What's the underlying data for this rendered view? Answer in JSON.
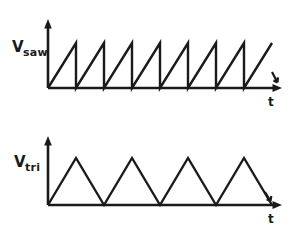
{
  "figure": {
    "background_color": "#ffffff",
    "ink_color": "#1a1a1a",
    "width": 295,
    "height": 231
  },
  "chart_data": [
    {
      "type": "line",
      "name": "sawtooth-waveform",
      "title": "",
      "ylabel": "V",
      "ylabel_subscript": "saw",
      "xlabel": "t",
      "waveform": "sawtooth",
      "cycles": 8,
      "period": 28,
      "amplitude": 45,
      "grid": false,
      "legend": false,
      "axis": {
        "origin_x": 48,
        "baseline_y": 88,
        "y_axis_top": 20,
        "x_axis_end": 282,
        "xlim": [
          0,
          8
        ],
        "ylim": [
          0,
          1
        ]
      },
      "x": [
        0,
        1,
        1,
        2,
        2,
        3,
        3,
        4,
        4,
        5,
        5,
        6,
        6,
        7,
        7,
        8
      ],
      "y": [
        0,
        1,
        0,
        1,
        0,
        1,
        0,
        1,
        0,
        1,
        0,
        1,
        0,
        1,
        0,
        1
      ],
      "description": "Eight rising ramps from zero to peak, each followed by an instantaneous vertical drop back to zero."
    },
    {
      "type": "line",
      "name": "triangle-waveform",
      "title": "",
      "ylabel": "V",
      "ylabel_subscript": "tri",
      "xlabel": "t",
      "waveform": "triangle",
      "cycles": 4,
      "period": 56,
      "amplitude": 47,
      "grid": false,
      "legend": false,
      "axis": {
        "origin_x": 48,
        "baseline_y": 205,
        "y_axis_top": 136,
        "x_axis_end": 282,
        "xlim": [
          0,
          4
        ],
        "ylim": [
          0,
          1
        ]
      },
      "x": [
        0,
        0.5,
        1,
        1.5,
        2,
        2.5,
        3,
        3.5,
        4
      ],
      "y": [
        0,
        1,
        0,
        1,
        0,
        1,
        0,
        1,
        0
      ],
      "description": "Four symmetric triangles rising linearly to peak then falling linearly back to zero."
    }
  ]
}
